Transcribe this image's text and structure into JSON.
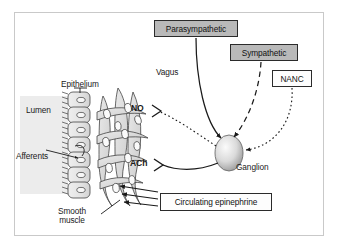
{
  "figure": {
    "background": "#ffffff",
    "frame_color": "#c9c9c9"
  },
  "boxes": [
    {
      "id": "parasympathetic",
      "label": "Parasympathetic",
      "fill": "#b9b9b9",
      "style": "gray",
      "x": 154,
      "y": 20,
      "w": 84,
      "h": 17
    },
    {
      "id": "sympathetic",
      "label": "Sympathetic",
      "fill": "#b9b9b9",
      "style": "gray",
      "x": 230,
      "y": 44,
      "w": 68,
      "h": 17
    },
    {
      "id": "nanc",
      "label": "NANC",
      "fill": "#fdfdfd",
      "style": "white",
      "x": 272,
      "y": 70,
      "w": 40,
      "h": 17
    },
    {
      "id": "circulating-epinephrine",
      "label": "Circulating epinephrine",
      "fill": "#fdfdfd",
      "style": "white",
      "x": 160,
      "y": 193,
      "w": 112,
      "h": 18
    }
  ],
  "labels": [
    {
      "id": "epithelium",
      "text": "Epithelium",
      "x": 61,
      "y": 80,
      "bold": false
    },
    {
      "id": "lumen",
      "text": "Lumen",
      "x": 26,
      "y": 106,
      "bold": false
    },
    {
      "id": "afferents",
      "text": "Afferents",
      "x": 16,
      "y": 152,
      "bold": false
    },
    {
      "id": "vagus",
      "text": "Vagus",
      "x": 156,
      "y": 68,
      "bold": false
    },
    {
      "id": "ganglion",
      "text": "Ganglion",
      "x": 236,
      "y": 163,
      "bold": false
    },
    {
      "id": "no",
      "text": "NO",
      "x": 142,
      "y": 110,
      "bold": true
    },
    {
      "id": "ach",
      "text": "ACh",
      "x": 134,
      "y": 163,
      "bold": true
    }
  ],
  "multiline_labels": [
    {
      "id": "smooth-muscle",
      "lines": [
        "Smooth",
        "muscle"
      ],
      "x": 66,
      "y": 207
    }
  ],
  "nerve_paths": [
    {
      "id": "vagus-nerve",
      "from": "parasympathetic",
      "to": "ganglion",
      "line_style": "solid",
      "terminal": "arrowhead"
    },
    {
      "id": "sympathetic-nerve",
      "from": "sympathetic",
      "to": "ganglion",
      "line_style": "dashed",
      "terminal": "arrowhead"
    },
    {
      "id": "nanc-nerve",
      "from": "nanc",
      "to": "ganglion",
      "line_style": "dotted",
      "terminal": "arrowhead"
    },
    {
      "id": "no-nerve",
      "from": "ganglion",
      "to": "smooth-muscle",
      "line_style": "dotted",
      "terminal": "synapse",
      "neurotransmitter": "NO"
    },
    {
      "id": "ach-nerve",
      "from": "ganglion",
      "to": "smooth-muscle",
      "line_style": "solid",
      "terminal": "synapse",
      "neurotransmitter": "ACh"
    }
  ],
  "epinephrine_arrows": {
    "count": 3,
    "direction": "right-to-left",
    "target": "smooth-muscle"
  },
  "anatomy": {
    "lumen_shade": "#ececec",
    "epithelium_cell_count": 7,
    "epithelium_fill": "#e8e8e8",
    "smooth_muscle_cell_count": 11,
    "smooth_muscle_fill": "#dcdcdc",
    "ganglion_fill_center": "#f2f2f2",
    "ganglion_fill_edge": "#9a9a9a"
  }
}
